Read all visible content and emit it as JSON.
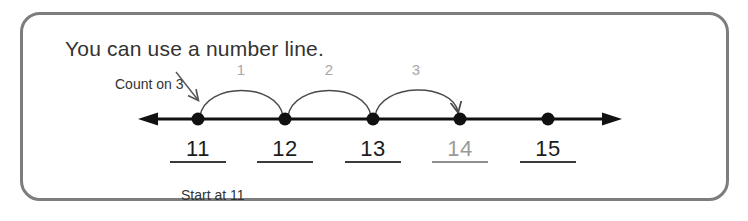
{
  "card": {
    "border_color": "#7d7d7d"
  },
  "title": "You can use a number line.",
  "annotation": {
    "count_on_label": "Count on 3",
    "start_caption": "Start at 11"
  },
  "number_line": {
    "left_arrow_icon": "left-arrowhead-icon",
    "right_arrow_icon": "right-arrowhead-icon",
    "line_color": "#111111",
    "points": [
      {
        "label": "11",
        "x": 198,
        "faded": false
      },
      {
        "label": "12",
        "x": 285,
        "faded": false
      },
      {
        "label": "13",
        "x": 373,
        "faded": false
      },
      {
        "label": "14",
        "x": 460,
        "faded": true
      },
      {
        "label": "15",
        "x": 548,
        "faded": false
      }
    ]
  },
  "hops": [
    {
      "label": "1",
      "x": 241,
      "from": 198,
      "to": 285
    },
    {
      "label": "2",
      "x": 329,
      "from": 285,
      "to": 373
    },
    {
      "label": "3",
      "x": 416,
      "from": 373,
      "to": 460
    }
  ],
  "colors": {
    "text": "#333333",
    "faded_text": "#9a9a9a",
    "hop_label": "#a8a8a8",
    "arc": "#4a4a4a"
  }
}
